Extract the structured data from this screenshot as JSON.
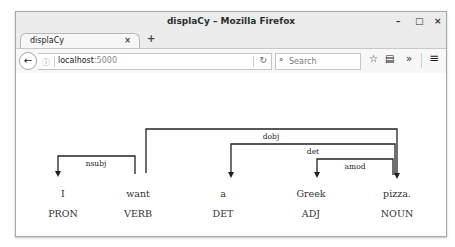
{
  "window": {
    "title": "displaCy – Mozilla Firefox",
    "controls": {
      "minimize": "–",
      "maximize": "□",
      "close": "×"
    }
  },
  "tabs": [
    {
      "label": "displaCy",
      "close": "×",
      "active": true
    }
  ],
  "new_tab_label": "+",
  "navbar": {
    "back_icon": "←",
    "info_icon": "ⓘ",
    "url_host": "localhost",
    "url_port": ":5000",
    "reload_icon": "↻",
    "search_icon": "⌕",
    "search_placeholder": "Search",
    "bookmark_icon": "☆",
    "clipboard_icon": "▤",
    "overflow_icon": "»",
    "menu_icon": "≡"
  },
  "parse": {
    "words": [
      {
        "text": "I",
        "tag": "PRON",
        "x": 47
      },
      {
        "text": "want",
        "tag": "VERB",
        "x": 122
      },
      {
        "text": "a",
        "tag": "DET",
        "x": 207
      },
      {
        "text": "Greek",
        "tag": "ADJ",
        "x": 295
      },
      {
        "text": "pizza.",
        "tag": "NOUN",
        "x": 381
      }
    ],
    "arcs": [
      {
        "label": "nsubj",
        "start": 0,
        "end": 1,
        "dir": "left"
      },
      {
        "label": "dobj",
        "start": 1,
        "end": 4,
        "dir": "right"
      },
      {
        "label": "det",
        "start": 2,
        "end": 4,
        "dir": "left"
      },
      {
        "label": "amod",
        "start": 3,
        "end": 4,
        "dir": "left"
      }
    ]
  }
}
